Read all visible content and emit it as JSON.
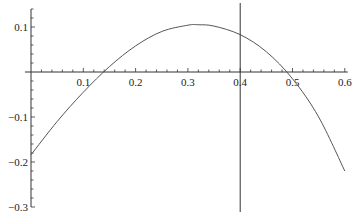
{
  "chart_data": {
    "type": "line",
    "title": "",
    "xlabel": "",
    "ylabel": "",
    "xlim": [
      0,
      0.6
    ],
    "ylim": [
      -0.3,
      0.14
    ],
    "grid": false,
    "legend": null,
    "x_ticks": [
      "0.1",
      "0.2",
      "0.3",
      "0.4",
      "0.5",
      "0.6"
    ],
    "y_ticks": [
      "0.1",
      "-0.1",
      "-0.2",
      "-0.3"
    ],
    "series": [
      {
        "name": "curve",
        "x": [
          0.0,
          0.05,
          0.1,
          0.15,
          0.2,
          0.25,
          0.3,
          0.32,
          0.35,
          0.4,
          0.45,
          0.5,
          0.55,
          0.6
        ],
        "values": [
          -0.184,
          -0.11,
          -0.045,
          0.012,
          0.058,
          0.09,
          0.104,
          0.105,
          0.102,
          0.083,
          0.045,
          -0.015,
          -0.1,
          -0.22
        ]
      }
    ],
    "annotations": [
      {
        "type": "vertical_line",
        "x": 0.4
      }
    ]
  },
  "axis_labels": {
    "x": [
      "0.1",
      "0.2",
      "0.3",
      "0.4",
      "0.5",
      "0.6"
    ],
    "y_pos": [
      "0.1"
    ],
    "y_neg": [
      "-0.1",
      "-0.2",
      "-0.3"
    ]
  }
}
